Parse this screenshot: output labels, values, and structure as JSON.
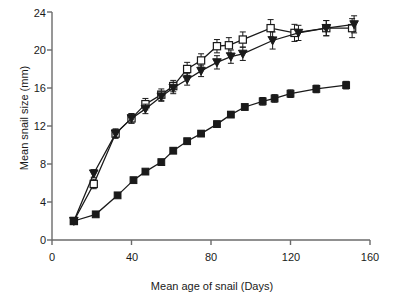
{
  "chart_data": {
    "type": "line",
    "title": "",
    "subtitle": "",
    "xlabel": "Mean age of snail (Days)",
    "ylabel": "Mean snail size (mm)",
    "xlim": [
      0,
      160
    ],
    "ylim": [
      0,
      24
    ],
    "xticks": [
      0,
      40,
      80,
      120,
      160
    ],
    "yticks": [
      0,
      4,
      8,
      12,
      16,
      20,
      24
    ],
    "grid": false,
    "legend": "none",
    "error_bars": "vertical, symmetric (SE)",
    "series": [
      {
        "name": "open-square-series",
        "marker": "open-square",
        "color": "#1a1a1a",
        "x": [
          11,
          21,
          32,
          40,
          47,
          55,
          61,
          68,
          75,
          83,
          89,
          96,
          110,
          122,
          138,
          151
        ],
        "values": [
          2.0,
          5.9,
          11.2,
          12.8,
          14.3,
          15.3,
          16.2,
          18.0,
          18.9,
          20.4,
          20.5,
          21.1,
          22.3,
          21.8,
          22.3,
          22.3
        ],
        "errors": [
          0.2,
          0.5,
          0.5,
          0.5,
          0.6,
          0.6,
          0.6,
          0.7,
          0.7,
          0.7,
          0.8,
          0.8,
          0.9,
          0.9,
          0.8,
          1.0
        ]
      },
      {
        "name": "filled-triangle-series",
        "marker": "filled-triangle-down",
        "color": "#1a1a1a",
        "x": [
          11,
          21,
          32,
          40,
          47,
          55,
          61,
          68,
          75,
          83,
          90,
          96,
          111,
          124,
          138,
          152
        ],
        "values": [
          2.0,
          7.0,
          11.2,
          12.8,
          13.8,
          15.1,
          16.0,
          16.9,
          17.8,
          18.7,
          19.3,
          19.6,
          21.0,
          21.8,
          22.3,
          22.7
        ],
        "errors": [
          0.2,
          0.4,
          0.4,
          0.5,
          0.5,
          0.5,
          0.6,
          0.6,
          0.6,
          0.7,
          0.7,
          0.7,
          0.9,
          0.8,
          0.8,
          0.9
        ]
      },
      {
        "name": "filled-square-series",
        "marker": "filled-square",
        "color": "#1a1a1a",
        "x": [
          11,
          22,
          33,
          41,
          47,
          55,
          61,
          68,
          75,
          83,
          90,
          97,
          106,
          112,
          120,
          133,
          148
        ],
        "values": [
          2.0,
          2.7,
          4.7,
          6.3,
          7.2,
          8.2,
          9.4,
          10.4,
          11.2,
          12.2,
          13.2,
          14.0,
          14.6,
          14.9,
          15.4,
          15.9,
          16.3
        ],
        "errors": [
          0.1,
          0.1,
          0.2,
          0.2,
          0.2,
          0.2,
          0.3,
          0.3,
          0.3,
          0.3,
          0.3,
          0.3,
          0.4,
          0.4,
          0.4,
          0.4,
          0.4
        ]
      }
    ]
  },
  "axes": {
    "ytick_labels": [
      "0",
      "4",
      "8",
      "12",
      "16",
      "20",
      "24"
    ],
    "xtick_labels": [
      "0",
      "40",
      "80",
      "120",
      "160"
    ],
    "ylabel_text": "Mean snail size (mm)",
    "xlabel_text": "Mean age of snail (Days)"
  },
  "colors": {
    "axis": "#6b6b6b",
    "ink": "#1a1a1a",
    "background": "#ffffff"
  }
}
